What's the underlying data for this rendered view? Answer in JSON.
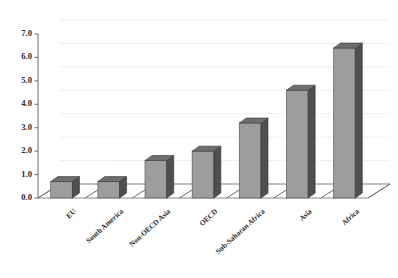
{
  "chart_data": {
    "type": "bar",
    "title": "",
    "xlabel": "",
    "ylabel": "",
    "ylim": [
      0.0,
      7.0
    ],
    "ytick_labels": [
      "0.0",
      "1.0",
      "2.0",
      "3.0",
      "4.0",
      "5.0",
      "6.0",
      "7.0"
    ],
    "ytick_values": [
      0.0,
      1.0,
      2.0,
      3.0,
      4.0,
      5.0,
      6.0,
      7.0
    ],
    "grid": true,
    "legend": "none",
    "style": "3d-bar",
    "categories": [
      "EU",
      "South America",
      "Non-OECD Asia",
      "OECD",
      "Sub-Saharan Africa",
      "Asia",
      "Africa"
    ],
    "values": [
      0.7,
      0.7,
      1.6,
      2.0,
      3.2,
      4.6,
      6.4
    ],
    "series": [
      {
        "name": "",
        "values": [
          0.7,
          0.7,
          1.6,
          2.0,
          3.2,
          4.6,
          6.4
        ]
      }
    ]
  },
  "colors": {
    "bar_front": "#9d9d9d",
    "bar_side": "#4f4f4f",
    "bar_top": "#6e6e6e",
    "axis": "#6a6a6a",
    "grid": "#c9c9c9",
    "background": "#ffffff",
    "text": "#2a2a2a"
  }
}
